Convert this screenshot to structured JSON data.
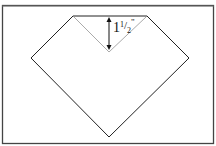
{
  "diagram": {
    "type": "folding-instruction",
    "measurement": {
      "whole": "1",
      "numerator": "1",
      "slash": "/",
      "denominator": "2",
      "unit": "\""
    },
    "colors": {
      "outline": "#222222",
      "fold_line": "#aaaaaa",
      "frame": "#444444",
      "background": "#ffffff"
    }
  }
}
